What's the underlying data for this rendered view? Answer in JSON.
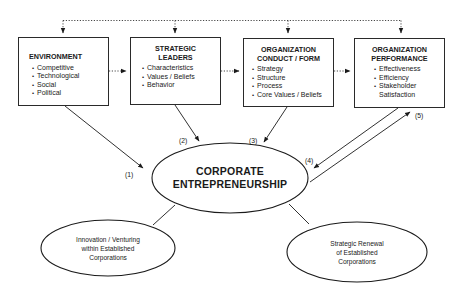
{
  "diagram": {
    "boxes": [
      {
        "id": "environment",
        "title": "ENVIRONMENT",
        "items": [
          "Competitive",
          "Technological",
          "Social",
          "Political"
        ]
      },
      {
        "id": "strategic-leaders",
        "title_lines": [
          "STRATEGIC",
          "LEADERS"
        ],
        "items": [
          "Characteristics",
          "Values / Beliefs",
          "Behavior"
        ]
      },
      {
        "id": "organization-conduct-form",
        "title_lines": [
          "ORGANIZATION",
          "CONDUCT / FORM"
        ],
        "items": [
          "Strategy",
          "Structure",
          "Process",
          "Core Values / Beliefs"
        ]
      },
      {
        "id": "organization-performance",
        "title_lines": [
          "ORGANIZATION",
          "PERFORMANCE"
        ],
        "items": [
          "Effectiveness",
          "Efficiency",
          "Stakeholder"
        ],
        "item_continuation": "Satisfaction"
      }
    ],
    "center": {
      "lines": [
        "CORPORATE",
        "ENTREPRENEURSHIP"
      ]
    },
    "outcomes": [
      {
        "id": "innovation-venturing",
        "lines": [
          "Innovation / Venturing",
          "within Established",
          "Corporations"
        ]
      },
      {
        "id": "strategic-renewal",
        "lines": [
          "Strategic Renewal",
          "of Established",
          "Corporations"
        ]
      }
    ],
    "path_labels": [
      "(1)",
      "(2)",
      "(3)",
      "(4)",
      "(5)"
    ]
  }
}
